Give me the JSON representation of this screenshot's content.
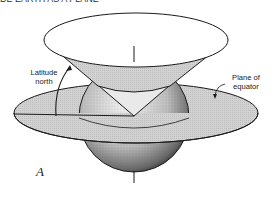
{
  "figure": {
    "truncated_header": "DE EARTH AS A PLANE",
    "panel_letter": "A",
    "labels": {
      "latitude": [
        "Latitude",
        "north"
      ],
      "plane": [
        "Plane of",
        "equator"
      ]
    },
    "colors": {
      "line": "#1a1a1a",
      "plane_fill": "#cfcfcf",
      "cone_fill": "#d4d4d4",
      "cone_top_fill": "#ffffff",
      "sphere_light": "#f2f2f2",
      "sphere_dark": "#2a2a2a"
    }
  }
}
